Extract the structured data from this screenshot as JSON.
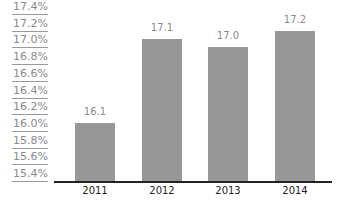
{
  "chart_data": {
    "type": "bar",
    "title": "",
    "xlabel": "",
    "ylabel": "",
    "categories": [
      "2011",
      "2012",
      "2013",
      "2014"
    ],
    "values": [
      16.1,
      17.1,
      17.0,
      17.2
    ],
    "value_labels": [
      "16.1",
      "17.1",
      "17.0",
      "17.2"
    ],
    "ylim": [
      15.4,
      17.4
    ],
    "y_ticks": [
      "17.4%",
      "17.2%",
      "17.0%",
      "16.8%",
      "16.6%",
      "16.4%",
      "16.2%",
      "16.0%",
      "15.8%",
      "15.6%",
      "15.4%"
    ],
    "grid": false,
    "legend": null,
    "bar_color": "#979797"
  }
}
